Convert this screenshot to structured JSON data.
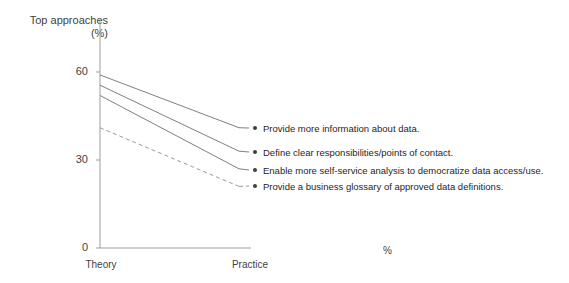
{
  "chart_data": {
    "type": "line",
    "title": "",
    "subtitle": "",
    "ylabel_line1": "Top approaches",
    "ylabel_line2": "(%)",
    "xlabel": "",
    "categories": [
      "Theory",
      "Practice"
    ],
    "x": [
      "Theory",
      "Practice"
    ],
    "yticks": [
      "0",
      "30",
      "60"
    ],
    "ytick_values": [
      0,
      30,
      60
    ],
    "ylim": [
      0,
      66
    ],
    "grid": false,
    "legend_position": "right-inline-labels",
    "axis_note": "%",
    "series": [
      {
        "name": "Provide more information about data.",
        "values": [
          59,
          41
        ],
        "style": "solid",
        "color": "#7f7f7f"
      },
      {
        "name": "Define clear responsibilities/points of contact.",
        "values": [
          55.5,
          33
        ],
        "style": "solid",
        "color": "#7f7f7f"
      },
      {
        "name": "Enable more self-service analysis to democratize data access/use.",
        "values": [
          52,
          27
        ],
        "style": "solid",
        "color": "#7f7f7f"
      },
      {
        "name": "Provide a business glossary of approved data definitions.",
        "values": [
          41,
          21
        ],
        "style": "dashed",
        "color": "#9a9a9a"
      }
    ],
    "endpoint_marker": "dot",
    "endpoint_marker_color": "#3f3f3f"
  },
  "labels": {
    "series_1": "Provide more information about data.",
    "series_2": "Define clear responsibilities/points of contact.",
    "series_3": "Enable more self-service analysis to democratize data access/use.",
    "series_4": "Provide a business glossary of approved data definitions."
  },
  "axes": {
    "y_title_line1": "Top approaches",
    "y_title_line2": "(%)",
    "y_tick_60": "60",
    "y_tick_30": "30",
    "y_tick_0": "0",
    "x_tick_theory": "Theory",
    "x_tick_practice": "Practice",
    "percent_note": "%"
  },
  "colors": {
    "line": "#7f7f7f",
    "dashed_line": "#9a9a9a",
    "axis": "#9d9d9d",
    "text": "#3f3f3f",
    "label_text": "#262626",
    "background": "#ffffff"
  }
}
